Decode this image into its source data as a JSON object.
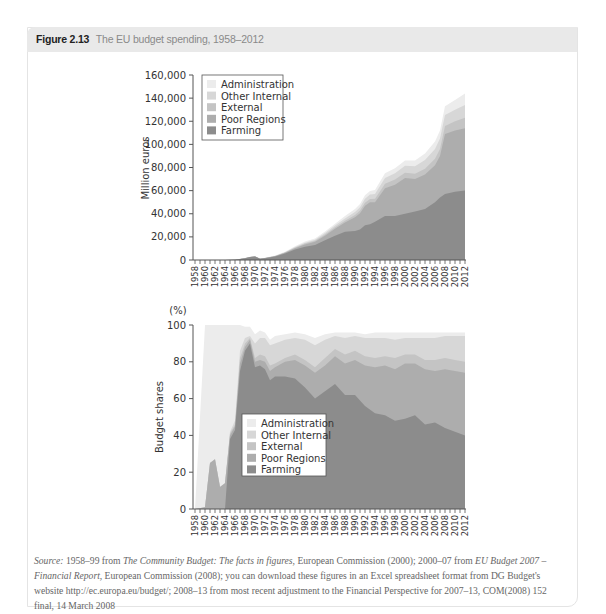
{
  "figure": {
    "number": "Figure 2.13",
    "title": "The EU budget spending, 1958–2012"
  },
  "source": {
    "label": "Source:",
    "segments": [
      {
        "text": " 1958–99 from ",
        "italic": false
      },
      {
        "text": "The Community Budget: The facts in figures",
        "italic": true
      },
      {
        "text": ", European Commission (2000); 2000–07 from ",
        "italic": false
      },
      {
        "text": "EU Budget 2007 – Financial Report",
        "italic": true
      },
      {
        "text": ", European Commission (2008); you can download these figures in an Excel spreadsheet format from DG Budget's website http://ec.europa.eu/budget/; 2008–13 from most recent adjustment to the Financial Perspective for 2007–13, COM(2008) 152 final, 14 March 2008",
        "italic": false
      }
    ]
  },
  "colors": {
    "Farming": "#8c8c8c",
    "Poor Regions": "#adadad",
    "External": "#c4c4c4",
    "Other Internal": "#d7d7d7",
    "Administration": "#ececec"
  },
  "chart_data": [
    {
      "type": "area",
      "stacked": true,
      "title": "",
      "xlabel": "",
      "ylabel": "Million euros",
      "ylim": [
        0,
        160000
      ],
      "yticks": [
        0,
        20000,
        40000,
        60000,
        80000,
        100000,
        120000,
        140000,
        160000
      ],
      "ytick_labels": [
        "0",
        "20,000",
        "40,000",
        "60,000",
        "80,000",
        "100,000",
        "120,000",
        "140,000",
        "160,000"
      ],
      "legend": [
        "Administration",
        "Other Internal",
        "External",
        "Poor Regions",
        "Farming"
      ],
      "legend_position": "upper left",
      "x": [
        1958,
        1960,
        1962,
        1964,
        1966,
        1968,
        1969,
        1970,
        1971,
        1972,
        1974,
        1976,
        1978,
        1980,
        1982,
        1984,
        1986,
        1988,
        1990,
        1991,
        1992,
        1993,
        1994,
        1996,
        1998,
        2000,
        2002,
        2004,
        2006,
        2007,
        2008,
        2010,
        2012
      ],
      "series": [
        {
          "name": "Farming",
          "values": [
            0,
            0,
            0,
            0,
            200,
            1500,
            2500,
            3000,
            1000,
            1500,
            3000,
            5500,
            9000,
            11500,
            13000,
            17000,
            21000,
            24500,
            25000,
            26500,
            30000,
            31000,
            33000,
            38000,
            38000,
            40000,
            42000,
            44000,
            50000,
            54000,
            57000,
            59000,
            60000
          ]
        },
        {
          "name": "Poor Regions",
          "values": [
            10,
            20,
            40,
            50,
            50,
            60,
            70,
            80,
            100,
            150,
            300,
            700,
            1200,
            2000,
            2700,
            4000,
            6000,
            8000,
            12000,
            14000,
            17000,
            19000,
            17000,
            24000,
            27000,
            31000,
            28000,
            30000,
            32000,
            36000,
            52000,
            53000,
            54000
          ]
        },
        {
          "name": "External",
          "values": [
            0,
            0,
            5,
            10,
            20,
            30,
            40,
            50,
            60,
            80,
            100,
            200,
            400,
            700,
            900,
            1100,
            1300,
            1500,
            2000,
            2200,
            2500,
            2800,
            3000,
            4000,
            4500,
            4500,
            4600,
            5000,
            5500,
            6000,
            7000,
            8000,
            9000
          ]
        },
        {
          "name": "Other Internal",
          "values": [
            0,
            0,
            5,
            10,
            20,
            30,
            40,
            50,
            60,
            80,
            100,
            300,
            600,
            800,
            1000,
            1200,
            1500,
            2000,
            2500,
            3000,
            3500,
            3800,
            4000,
            5000,
            5500,
            6000,
            6500,
            7500,
            8500,
            9000,
            9500,
            10000,
            11000
          ]
        },
        {
          "name": "Administration",
          "values": [
            5,
            10,
            20,
            30,
            50,
            80,
            100,
            120,
            150,
            200,
            300,
            500,
            700,
            900,
            1100,
            1300,
            1600,
            2000,
            2500,
            2800,
            3000,
            3200,
            3500,
            4000,
            4300,
            4600,
            5000,
            5500,
            6500,
            7000,
            7500,
            8500,
            10000
          ]
        }
      ]
    },
    {
      "type": "area",
      "stacked": true,
      "title": "",
      "xlabel": "",
      "ylabel": "Budget shares",
      "yunit": "(%)",
      "ylim": [
        0,
        100
      ],
      "yticks": [
        0,
        20,
        40,
        60,
        80,
        100
      ],
      "legend": [
        "Administration",
        "Other Internal",
        "External",
        "Poor Regions",
        "Farming"
      ],
      "legend_position": "center left",
      "x": [
        1958,
        1960,
        1961,
        1962,
        1963,
        1964,
        1965,
        1966,
        1967,
        1968,
        1969,
        1970,
        1971,
        1972,
        1973,
        1974,
        1976,
        1978,
        1980,
        1982,
        1984,
        1986,
        1988,
        1990,
        1992,
        1994,
        1996,
        1998,
        2000,
        2002,
        2004,
        2006,
        2008,
        2010,
        2012
      ],
      "series": [
        {
          "name": "Farming",
          "values": [
            0,
            0,
            0,
            0,
            0,
            0,
            38,
            43,
            75,
            86,
            90,
            77,
            78,
            76,
            70,
            72,
            72,
            71,
            66,
            60,
            64,
            68,
            62,
            62,
            56,
            52,
            51,
            48,
            49,
            51,
            46,
            47,
            44,
            42,
            40
          ]
        },
        {
          "name": "Poor Regions",
          "values": [
            0,
            1,
            25,
            27,
            12,
            14,
            2,
            2,
            4,
            2,
            2,
            3,
            3,
            4,
            5,
            5,
            8,
            10,
            12,
            14,
            14,
            15,
            17,
            19,
            22,
            25,
            27,
            28,
            30,
            28,
            30,
            28,
            32,
            33,
            34
          ]
        },
        {
          "name": "External",
          "values": [
            0,
            0,
            0,
            0,
            0,
            0,
            1,
            1,
            3,
            2,
            1,
            2,
            3,
            3,
            3,
            2,
            2,
            3,
            3,
            3,
            4,
            4,
            5,
            5,
            5,
            5,
            5,
            6,
            5,
            5,
            5,
            6,
            6,
            6,
            6
          ]
        },
        {
          "name": "Other Internal",
          "values": [
            0,
            0,
            0,
            0,
            0,
            0,
            1,
            2,
            4,
            3,
            1,
            8,
            9,
            10,
            11,
            11,
            10,
            9,
            11,
            12,
            10,
            7,
            9,
            8,
            10,
            11,
            10,
            10,
            9,
            9,
            12,
            12,
            12,
            13,
            14
          ]
        },
        {
          "name": "Administration",
          "values": [
            0,
            99,
            75,
            73,
            88,
            86,
            58,
            52,
            14,
            6,
            5,
            5,
            4,
            3,
            3,
            4,
            3,
            3,
            3,
            4,
            3,
            2,
            3,
            2,
            2,
            3,
            3,
            4,
            3,
            3,
            3,
            3,
            2,
            2,
            2
          ]
        }
      ],
      "notes": "Total reaches ~93-95% from 1970 onward; remaining band up to 100 is unshaded (white) above Administration"
    }
  ],
  "charts": {
    "top": {
      "ylabel": "Million euros",
      "yticks": [
        "0",
        "20,000",
        "40,000",
        "60,000",
        "80,000",
        "100,000",
        "120,000",
        "140,000",
        "160,000"
      ]
    },
    "bottom": {
      "ylabel": "Budget shares",
      "yunit": "(%)",
      "yticks": [
        "0",
        "20",
        "40",
        "60",
        "80",
        "100"
      ]
    },
    "xticks": [
      "1958",
      "1960",
      "1962",
      "1964",
      "1966",
      "1968",
      "1970",
      "1972",
      "1974",
      "1976",
      "1978",
      "1980",
      "1982",
      "1984",
      "1986",
      "1988",
      "1990",
      "1992",
      "1994",
      "1996",
      "1998",
      "2000",
      "2002",
      "2004",
      "2006",
      "2008",
      "2010",
      "2012"
    ],
    "legend": [
      "Administration",
      "Other Internal",
      "External",
      "Poor Regions",
      "Farming"
    ]
  }
}
